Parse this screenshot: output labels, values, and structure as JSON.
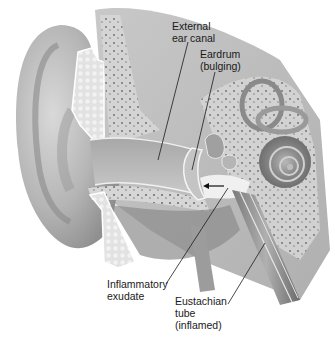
{
  "figure": {
    "labels": [
      {
        "id": "external-ear-canal",
        "text": "External\near canal"
      },
      {
        "id": "eardrum",
        "text": "Eardrum\n(bulging)"
      },
      {
        "id": "inflammatory-exudate",
        "text": "Inflammatory\nexudate"
      },
      {
        "id": "eustachian-tube",
        "text": "Eustachian\ntube\n(inflamed)"
      }
    ],
    "colors": {
      "background": "#ffffff",
      "skin_light": "#e6e6e6",
      "skin_mid": "#bdbdbd",
      "skin_dark": "#8a8a8a",
      "bone": "#d4d4d4",
      "leader_line": "#1a1a1a"
    }
  }
}
